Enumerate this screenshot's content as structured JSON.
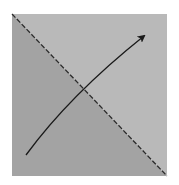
{
  "diagram": {
    "square": {
      "x": 12,
      "y": 14,
      "width": 155,
      "height": 162
    },
    "colors": {
      "background": "#ffffff",
      "upper_right_region": "#b9b9b9",
      "lower_left_region": "#a3a3a3",
      "diagonal_line": "#2a2a2a",
      "arrow": "#1a1a1a"
    },
    "diagonal": {
      "style": "dashed",
      "from": [
        12,
        14
      ],
      "to": [
        167,
        176
      ]
    },
    "arrow": {
      "from": [
        26,
        155
      ],
      "control": [
        70,
        95
      ],
      "to": [
        144,
        36
      ]
    }
  }
}
